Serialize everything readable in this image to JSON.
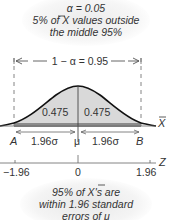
{
  "header": {
    "alpha_line": "α = 0.05",
    "line2": "5% of X values outside",
    "line3": "the middle 95%"
  },
  "interval_label": "1 − α = 0.95",
  "areas": {
    "left": "0.475",
    "right": "0.475"
  },
  "labels": {
    "A": "A",
    "B": "B",
    "mu": "μ",
    "left_width": "1.96σ",
    "right_width": "1.96σ",
    "xbar_axis": "X",
    "z_axis": "Z"
  },
  "z_ticks": [
    "−1.96",
    "0",
    "1.96"
  ],
  "footer": {
    "line1": "95% of X's are",
    "line2": "within 1.96 standard",
    "line3": "errors of μ"
  },
  "colors": {
    "fill": "#d9d9d9",
    "band": "#8c8c8c",
    "curve": "#111111",
    "text": "#333333"
  }
}
